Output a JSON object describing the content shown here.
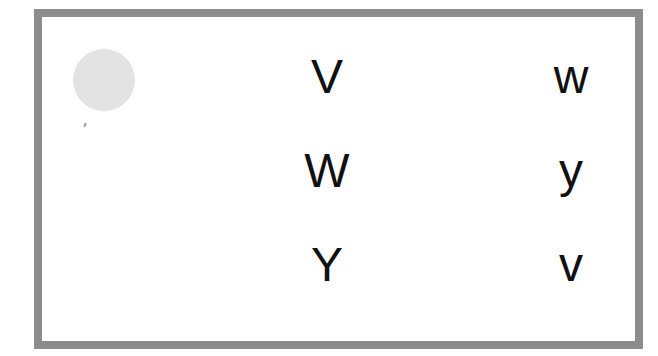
{
  "card": {
    "border_color": "#8c8c8c",
    "circle_color": "#e3e3e3"
  },
  "left_column": [
    "V",
    "W",
    "Y"
  ],
  "right_column": [
    "w",
    "y",
    "v"
  ]
}
